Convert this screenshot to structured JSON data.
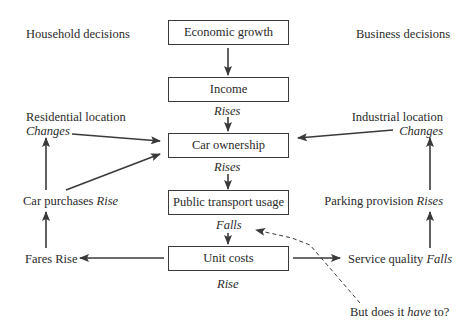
{
  "headers": {
    "household": "Household decisions",
    "business": "Business decisions"
  },
  "boxes": [
    {
      "label": "Economic growth"
    },
    {
      "label": "Income"
    },
    {
      "label": "Car ownership"
    },
    {
      "label": "Public transport usage"
    },
    {
      "label": "Unit costs"
    }
  ],
  "effects": {
    "income": "Rises",
    "car_ownership": "Rises",
    "public_transport": "Falls",
    "unit_costs": "Rise"
  },
  "left": {
    "residential_location": "Residential location",
    "residential_changes": "Changes",
    "car_purchases": "Car purchases",
    "car_purchases_effect": "Rise",
    "fares": "Fares Rise"
  },
  "right": {
    "industrial_location": "Industrial location",
    "industrial_changes": "Changes",
    "parking": "Parking provision",
    "parking_effect": "Rises",
    "service_quality": "Service quality",
    "service_quality_effect": "Falls"
  },
  "question": {
    "prefix": "But does it",
    "emphasis": "have",
    "suffix": "to?"
  },
  "colors": {
    "line": "#3a3a3a",
    "text": "#2a2a2a",
    "background": "#ffffff"
  }
}
